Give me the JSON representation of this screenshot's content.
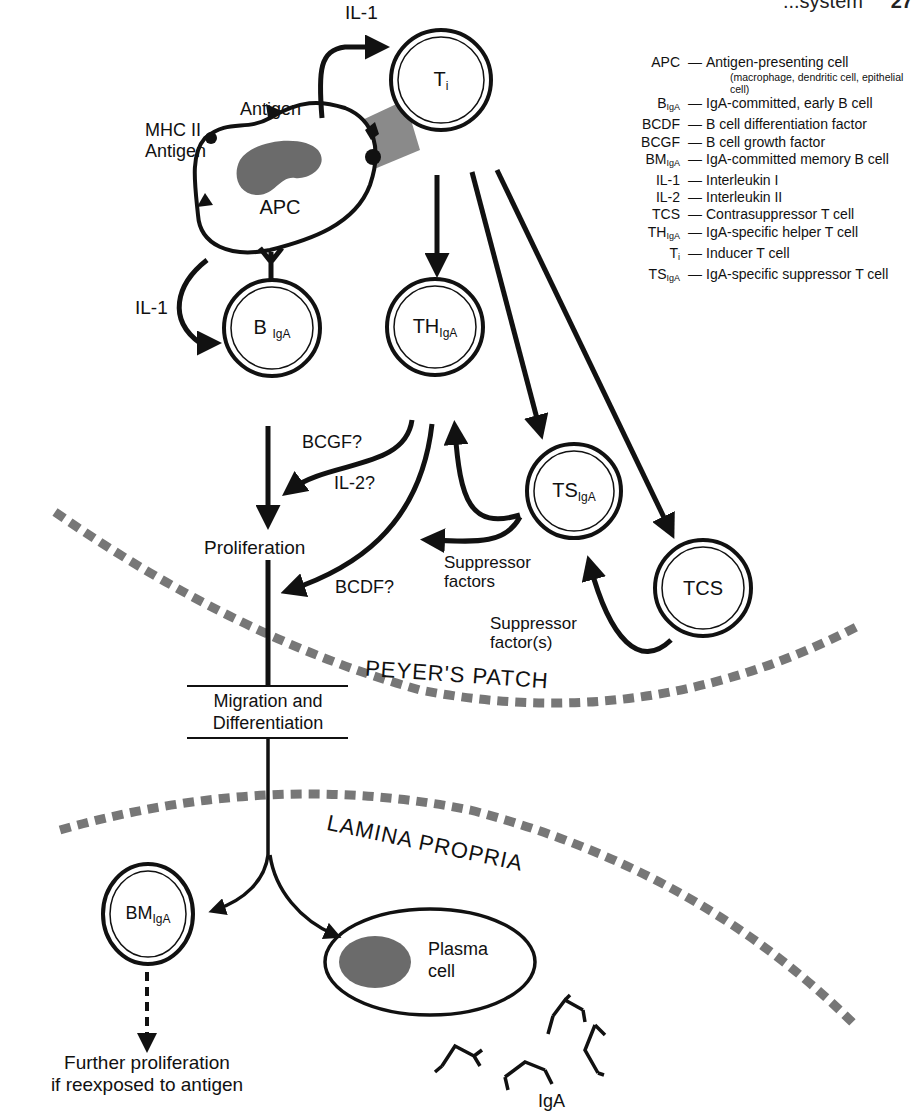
{
  "header": {
    "running_title": "...system",
    "page_number": "27"
  },
  "cells": {
    "apc": {
      "label": "APC"
    },
    "ti": {
      "main": "T",
      "sub": "i"
    },
    "b_iga": {
      "main": "B",
      "sub": "IgA"
    },
    "th_iga": {
      "main": "TH",
      "sub": "IgA"
    },
    "ts_iga": {
      "main": "TS",
      "sub": "IgA"
    },
    "tcs": {
      "main": "TCS",
      "sub": ""
    },
    "bm_iga": {
      "main": "BM",
      "sub": "IgA"
    },
    "plasma": {
      "line1": "Plasma",
      "line2": "cell"
    }
  },
  "labels": {
    "il1_top": "IL-1",
    "antigen": "Antigen",
    "mhc_line1": "MHC II",
    "mhc_line2": "Antigen",
    "il1_left": "IL-1",
    "bcgf": "BCGF?",
    "il2": "IL-2?",
    "bcdf": "BCDF?",
    "proliferation": "Proliferation",
    "suppressor_factors_line1": "Suppressor",
    "suppressor_factors_line2": "factors",
    "suppressor_factor_s_line1": "Suppressor",
    "suppressor_factor_s_line2": "factor(s)",
    "migration_line1": "Migration and",
    "migration_line2": "Differentiation",
    "peyers_patch": "PEYER'S PATCH",
    "lamina_propria": "LAMINA PROPRIA",
    "further_line1": "Further proliferation",
    "further_line2": "if reexposed to antigen",
    "iga": "IgA"
  },
  "legend": {
    "items": [
      {
        "abbr": "APC",
        "sub": "",
        "desc": "Antigen-presenting cell",
        "note": "(macrophage, dendritic cell, epithelial cell)"
      },
      {
        "abbr": "B",
        "sub": "IgA",
        "desc": "IgA-committed, early B cell",
        "note": ""
      },
      {
        "abbr": "BCDF",
        "sub": "",
        "desc": "B cell differentiation factor",
        "note": ""
      },
      {
        "abbr": "BCGF",
        "sub": "",
        "desc": "B cell growth factor",
        "note": ""
      },
      {
        "abbr": "BM",
        "sub": "IgA",
        "desc": "IgA-committed memory B cell",
        "note": ""
      },
      {
        "abbr": "IL-1",
        "sub": "",
        "desc": "Interleukin I",
        "note": ""
      },
      {
        "abbr": "IL-2",
        "sub": "",
        "desc": "Interleukin II",
        "note": ""
      },
      {
        "abbr": "TCS",
        "sub": "",
        "desc": "Contrasuppressor T cell",
        "note": ""
      },
      {
        "abbr": "TH",
        "sub": "IgA",
        "desc": "IgA-specific helper T cell",
        "note": ""
      },
      {
        "abbr": "T",
        "sub": "i",
        "desc": "Inducer T cell",
        "note": ""
      },
      {
        "abbr": "TS",
        "sub": "IgA",
        "desc": "IgA-specific suppressor T cell",
        "note": ""
      }
    ],
    "dash": "—"
  },
  "colors": {
    "ink": "#111111",
    "nucleus": "#6b6b6b",
    "boundary": "#777777",
    "contact": "#8a8a8a"
  }
}
